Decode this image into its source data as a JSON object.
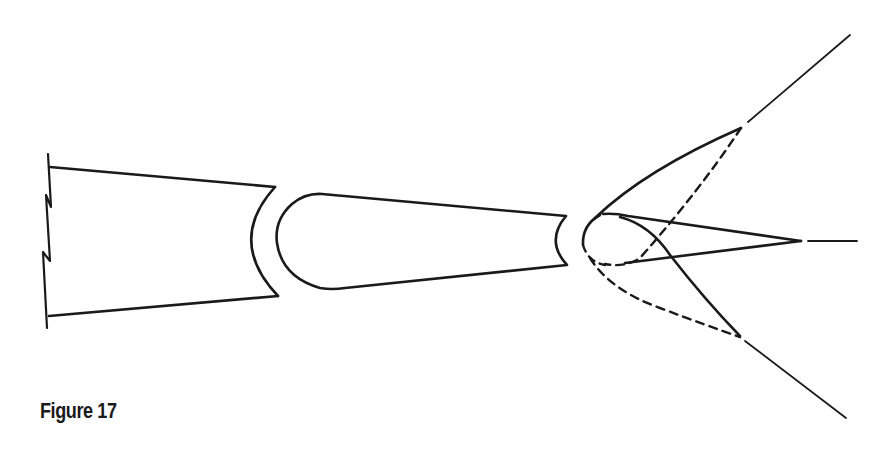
{
  "figure": {
    "caption": "Figure 17",
    "ink_color": "#1a1a1a",
    "background": "#ffffff",
    "parts": [
      {
        "name": "wing-root-section",
        "description": "Truncated section with zigzag break line on left and concave cut on right"
      },
      {
        "name": "airfoil-mid-section",
        "description": "Tapered airfoil section with rounded leading edge and concave trailing cut"
      },
      {
        "name": "swept-tip-section",
        "description": "Nose section with solid and dashed swept lines diverging to upper and lower rays, center spike with trailing dash"
      }
    ]
  }
}
